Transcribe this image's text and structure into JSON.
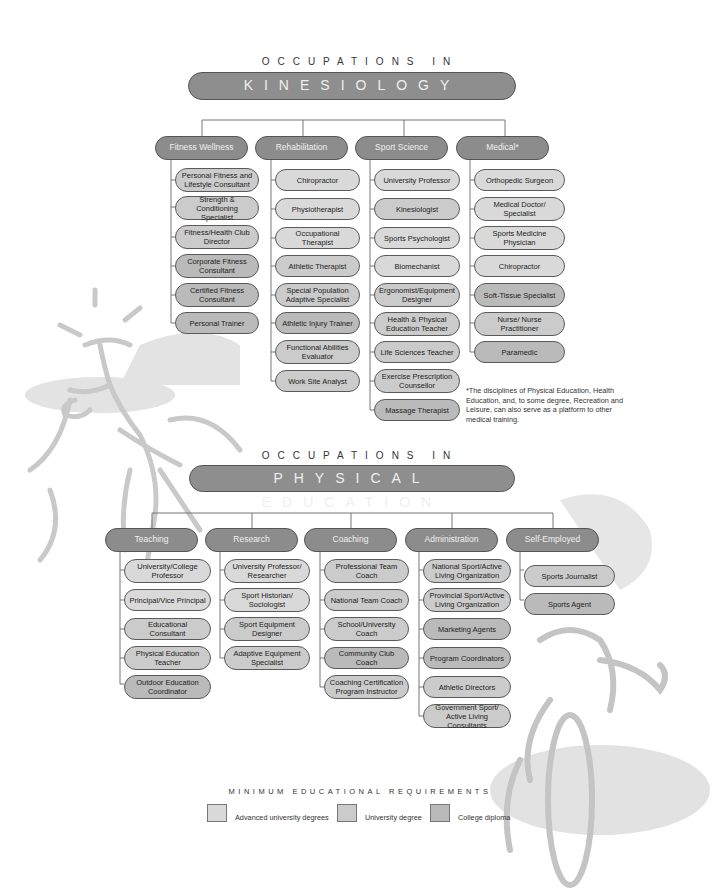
{
  "kinesiology": {
    "kicker": "OCCUPATIONS IN",
    "title": "KINESIOLOGY",
    "categories": [
      {
        "label": "Fitness Wellness",
        "jobs": [
          {
            "label": "Personal Fitness and Lifestyle Consultant",
            "level": "uni"
          },
          {
            "label": "Strength & Conditioning Specialist",
            "level": "uni"
          },
          {
            "label": "Fitness/Health Club Director",
            "level": "uni"
          },
          {
            "label": "Corporate Fitness Consultant",
            "level": "col"
          },
          {
            "label": "Certified Fitness Consultant",
            "level": "col"
          },
          {
            "label": "Personal Trainer",
            "level": "col"
          }
        ]
      },
      {
        "label": "Rehabilitation",
        "jobs": [
          {
            "label": "Chiropractor",
            "level": "adv"
          },
          {
            "label": "Physiotherapist",
            "level": "adv"
          },
          {
            "label": "Occupational Therapist",
            "level": "adv"
          },
          {
            "label": "Athletic Therapist",
            "level": "uni"
          },
          {
            "label": "Special Population Adaptive Specialist",
            "level": "uni"
          },
          {
            "label": "Athletic Injury Trainer",
            "level": "col"
          },
          {
            "label": "Functional Abilities Evaluator",
            "level": "uni"
          },
          {
            "label": "Work Site Analyst",
            "level": "uni"
          }
        ]
      },
      {
        "label": "Sport Science",
        "jobs": [
          {
            "label": "University Professor",
            "level": "adv"
          },
          {
            "label": "Kinesiologist",
            "level": "uni"
          },
          {
            "label": "Sports Psychologist",
            "level": "adv"
          },
          {
            "label": "Biomechanist",
            "level": "adv"
          },
          {
            "label": "Ergonomist/Equipment Designer",
            "level": "uni"
          },
          {
            "label": "Health & Physical Education Teacher",
            "level": "uni"
          },
          {
            "label": "Life Sciences Teacher",
            "level": "uni"
          },
          {
            "label": "Exercise Prescription Counsellor",
            "level": "uni"
          },
          {
            "label": "Massage Therapist",
            "level": "col"
          }
        ]
      },
      {
        "label": "Medical*",
        "jobs": [
          {
            "label": "Orthopedic Surgeon",
            "level": "adv"
          },
          {
            "label": "Medical Doctor/ Specialist",
            "level": "adv"
          },
          {
            "label": "Sports Medicine Physician",
            "level": "adv"
          },
          {
            "label": "Chiropractor",
            "level": "adv"
          },
          {
            "label": "Soft-Tissue Specialist",
            "level": "col"
          },
          {
            "label": "Nurse/ Nurse Practitioner",
            "level": "uni"
          },
          {
            "label": "Paramedic",
            "level": "col"
          }
        ]
      }
    ],
    "footnote": "*The disciplines of Physical Education, Health Education, and, to some degree, Recreation and Leisure, can also serve as a platform to other medical training."
  },
  "physical_education": {
    "kicker": "OCCUPATIONS IN",
    "title": "PHYSICAL EDUCATION",
    "categories": [
      {
        "label": "Teaching",
        "jobs": [
          {
            "label": "University/College Professor",
            "level": "adv"
          },
          {
            "label": "Principal/Vice Principal",
            "level": "adv"
          },
          {
            "label": "Educational Consultant",
            "level": "uni"
          },
          {
            "label": "Physical Education Teacher",
            "level": "uni"
          },
          {
            "label": "Outdoor Education Coordinator",
            "level": "col"
          }
        ]
      },
      {
        "label": "Research",
        "jobs": [
          {
            "label": "University Professor/ Researcher",
            "level": "adv"
          },
          {
            "label": "Sport Historian/ Sociologist",
            "level": "adv"
          },
          {
            "label": "Sport Equipment Designer",
            "level": "uni"
          },
          {
            "label": "Adaptive Equipment Specialist",
            "level": "uni"
          }
        ]
      },
      {
        "label": "Coaching",
        "jobs": [
          {
            "label": "Professional Team Coach",
            "level": "uni"
          },
          {
            "label": "National Team Coach",
            "level": "uni"
          },
          {
            "label": "School/University Coach",
            "level": "uni"
          },
          {
            "label": "Community Club Coach",
            "level": "col"
          },
          {
            "label": "Coaching Certification Program Instructor",
            "level": "uni"
          }
        ]
      },
      {
        "label": "Administration",
        "jobs": [
          {
            "label": "National Sport/Active Living Organization",
            "level": "uni"
          },
          {
            "label": "Provincial Sport/Active Living Organization",
            "level": "uni"
          },
          {
            "label": "Marketing Agents",
            "level": "col"
          },
          {
            "label": "Program Coordinators",
            "level": "col"
          },
          {
            "label": "Athletic Directors",
            "level": "uni"
          },
          {
            "label": "Government Sport/ Active Living Consultants",
            "level": "uni"
          }
        ]
      },
      {
        "label": "Self-Employed",
        "jobs": [
          {
            "label": "Sports Journalist",
            "level": "uni"
          },
          {
            "label": "Sports Agent",
            "level": "col"
          }
        ]
      }
    ]
  },
  "legend": {
    "title": "MINIMUM EDUCATIONAL REQUIREMENTS",
    "items": [
      {
        "label": "Advanced university degrees",
        "color": "#d9d9d9"
      },
      {
        "label": "University degree",
        "color": "#cbcbcb"
      },
      {
        "label": "College diploma",
        "color": "#bababa"
      }
    ]
  },
  "colors": {
    "title_bar": "#8e8e8e",
    "category": "#8c8c8c",
    "connector": "#777777",
    "illustration": "#c8c8c8"
  }
}
